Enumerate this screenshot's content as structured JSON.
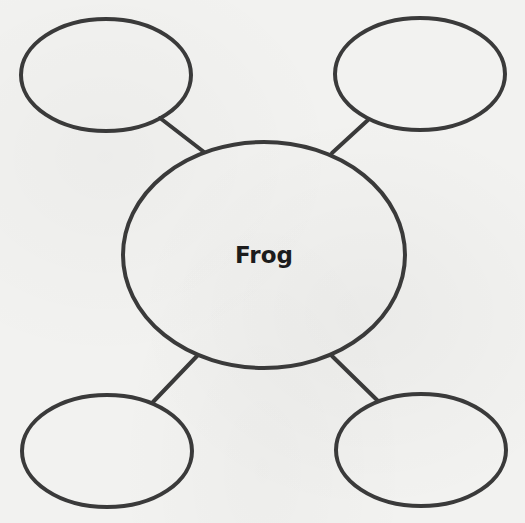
{
  "diagram": {
    "type": "web-organizer",
    "stroke_color": "#3a3a3a",
    "background_color": "#f2f2f0",
    "center": {
      "label": "Frog",
      "cx": 264,
      "cy": 255,
      "rx": 141,
      "ry": 113
    },
    "nodes": [
      {
        "id": "top-left",
        "label": "",
        "cx": 106,
        "cy": 75,
        "rx": 85,
        "ry": 56
      },
      {
        "id": "top-right",
        "label": "",
        "cx": 420,
        "cy": 74,
        "rx": 85,
        "ry": 56
      },
      {
        "id": "bottom-left",
        "label": "",
        "cx": 107,
        "cy": 451,
        "rx": 85,
        "ry": 56
      },
      {
        "id": "bottom-right",
        "label": "",
        "cx": 421,
        "cy": 450,
        "rx": 85,
        "ry": 56
      }
    ],
    "connectors": [
      {
        "from": "top-left",
        "x1": 160,
        "y1": 118,
        "x2": 204,
        "y2": 152
      },
      {
        "from": "top-right",
        "x1": 368,
        "y1": 120,
        "x2": 332,
        "y2": 153
      },
      {
        "from": "bottom-left",
        "x1": 153,
        "y1": 402,
        "x2": 197,
        "y2": 356
      },
      {
        "from": "bottom-right",
        "x1": 378,
        "y1": 401,
        "x2": 332,
        "y2": 356
      }
    ]
  }
}
